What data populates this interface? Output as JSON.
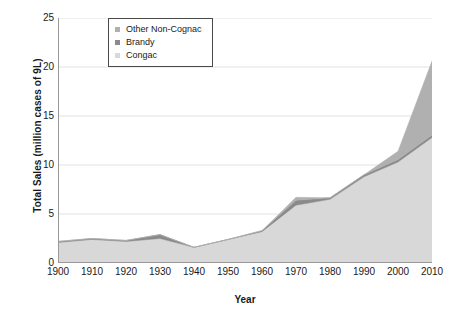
{
  "chart_data": {
    "type": "area",
    "stacked": true,
    "title": "",
    "xlabel": "Year",
    "ylabel": "Total Sales (million cases of 9L)",
    "x": [
      1900,
      1910,
      1920,
      1930,
      1940,
      1950,
      1960,
      1970,
      1980,
      1990,
      2000,
      2010
    ],
    "xticklabels": [
      "1900",
      "1910",
      "1920",
      "1930",
      "1940",
      "1950",
      "1960",
      "1970",
      "1980",
      "1990",
      "2000",
      "2010"
    ],
    "yticklabels": [
      "0",
      "5",
      "10",
      "15",
      "20",
      "25"
    ],
    "yticks": [
      0,
      5,
      10,
      15,
      20,
      25
    ],
    "xlim": [
      1900,
      2010
    ],
    "ylim": [
      0,
      25
    ],
    "grid": "horizontal",
    "legend_position": "top-left-inside",
    "stack_order_bottom_to_top": [
      "Congac",
      "Brandy",
      "Other Non-Cognac"
    ],
    "series": [
      {
        "name": "Congac",
        "color": "#d8d8d8",
        "values": [
          2.1,
          2.4,
          2.2,
          2.5,
          1.6,
          2.4,
          3.2,
          5.9,
          6.5,
          8.8,
          10.3,
          12.8
        ]
      },
      {
        "name": "Brandy",
        "color": "#8a8a8a",
        "values": [
          0.1,
          0.1,
          0.1,
          0.4,
          0.0,
          0.0,
          0.1,
          0.5,
          0.15,
          0.2,
          0.25,
          0.25
        ]
      },
      {
        "name": "Other Non-Cognac",
        "color": "#b0b0b0",
        "values": [
          0.0,
          0.0,
          0.0,
          0.0,
          0.0,
          0.0,
          0.0,
          0.3,
          0.0,
          0.0,
          0.85,
          7.55
        ]
      }
    ],
    "cumulative_totals": [
      2.2,
      2.5,
      2.3,
      2.9,
      1.6,
      2.4,
      3.3,
      6.7,
      6.65,
      9.0,
      11.4,
      20.6
    ]
  },
  "legend": {
    "items": [
      {
        "label": "Other Non-Cognac",
        "color": "#b0b0b0"
      },
      {
        "label": "Brandy",
        "color": "#8a8a8a"
      },
      {
        "label": "Congac",
        "color": "#d8d8d8"
      }
    ]
  },
  "axes": {
    "y_title": "Total Sales (million cases of 9L)",
    "x_title": "Year"
  },
  "colors": {
    "background": "#ffffff",
    "axis_line": "#9a9a9a",
    "grid_line": "#e2e2e2",
    "text": "#1a1a1a",
    "legend_border": "#4a4a4a"
  }
}
